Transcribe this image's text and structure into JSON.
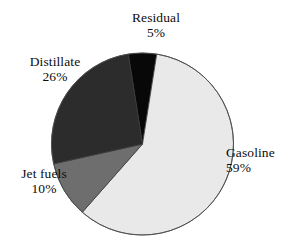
{
  "chart_data": {
    "type": "pie",
    "title": "",
    "subtitle": "",
    "xlabel": "",
    "ylabel": "",
    "legend_position": "none",
    "grid": false,
    "units": "percent",
    "total": 100,
    "start_angle_deg": -9,
    "direction": "clockwise",
    "categories": [
      "Residual",
      "Gasoline",
      "Jet fuels",
      "Distillate"
    ],
    "values": [
      5,
      59,
      10,
      26
    ],
    "labels_display": [
      "5%",
      "59%",
      "10%",
      "26%"
    ],
    "slices": [
      {
        "name": "Residual",
        "value": 5,
        "value_text": "5%",
        "color": "#080808",
        "start_deg": -9,
        "end_deg": 9,
        "label_position": "top"
      },
      {
        "name": "Gasoline",
        "value": 59,
        "value_text": "59%",
        "color": "#e9e9e9",
        "start_deg": 9,
        "end_deg": 221.4,
        "label_position": "right"
      },
      {
        "name": "Jet fuels",
        "value": 10,
        "value_text": "10%",
        "color": "#6e6e6e",
        "start_deg": 221.4,
        "end_deg": 257.4,
        "label_position": "left-bottom"
      },
      {
        "name": "Distillate",
        "value": 26,
        "value_text": "26%",
        "color": "#2c2c2c",
        "start_deg": 257.4,
        "end_deg": 351,
        "label_position": "left-top"
      }
    ],
    "geometry": {
      "center_x": 142.5,
      "center_y": 144,
      "radius": 91,
      "stroke_color": "#3a3a3a",
      "stroke_width": 0.8
    },
    "background_color": "#ffffff"
  }
}
